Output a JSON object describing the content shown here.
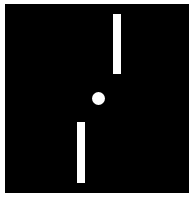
{
  "game": {
    "type": "pong",
    "colors": {
      "background": "#000000",
      "foreground": "#ffffff",
      "border": "#ffffff"
    },
    "field": {
      "x": 5,
      "y": 4,
      "width": 184,
      "height": 189
    },
    "paddles": [
      {
        "id": "top-right",
        "x": 113,
        "y": 14,
        "width": 8,
        "height": 60
      },
      {
        "id": "bottom-left",
        "x": 77,
        "y": 122,
        "width": 8,
        "height": 61
      }
    ],
    "ball": {
      "x": 92,
      "y": 92,
      "diameter": 13
    }
  }
}
